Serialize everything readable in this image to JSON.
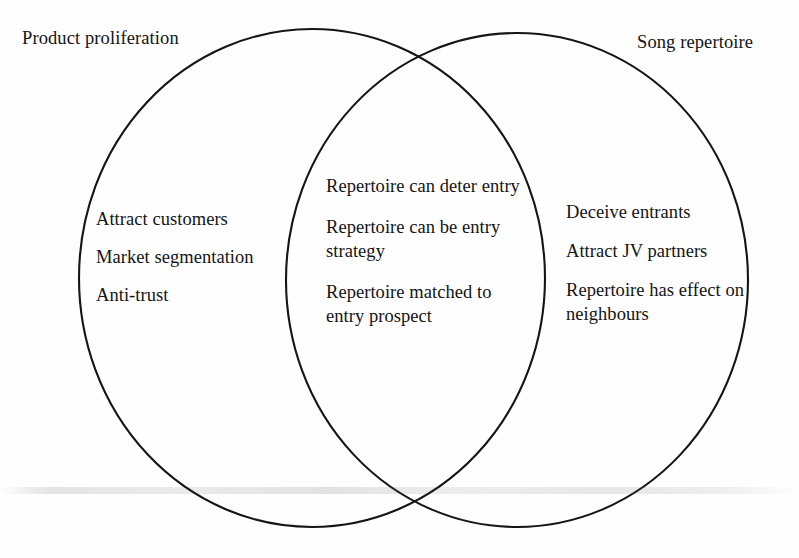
{
  "diagram": {
    "type": "venn",
    "sets": 2,
    "background_color": "#fefefe",
    "outline_color": "#151515",
    "text_color": "#141414",
    "left": {
      "label": "Product proliferation",
      "items": [
        "Attract customers",
        "Market segmentation",
        "Anti-trust"
      ]
    },
    "right": {
      "label": "Song repertoire",
      "items": [
        "Deceive entrants",
        "Attract JV partners",
        "Repertoire has effect on neighbours"
      ]
    },
    "intersection": {
      "items": [
        "Repertoire can deter entry",
        "Repertoire can be entry strategy",
        "Repertoire matched to entry prospect"
      ]
    }
  }
}
